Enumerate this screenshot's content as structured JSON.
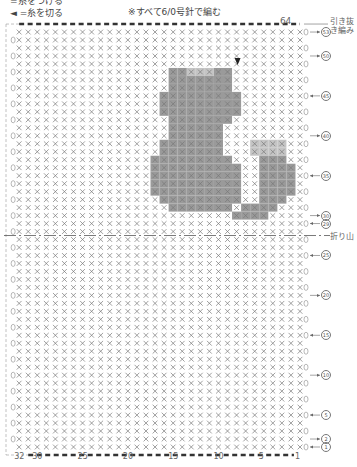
{
  "legend": {
    "attach_label": "=糸をつける",
    "cut_label": "◄ =糸を切る"
  },
  "note": "※すべて6/0号針で編む",
  "top_stitch_count": "64",
  "slip_stitch_label": "引き抜き編み",
  "fold_label": "折り山",
  "columns": {
    "count": 32,
    "bottom_labels": [
      "32",
      "30",
      "25",
      "20",
      "15",
      "10",
      "5",
      "1"
    ],
    "label_cols": [
      32,
      30,
      25,
      20,
      15,
      10,
      5,
      1
    ]
  },
  "rows": {
    "count": 53,
    "markers": [
      {
        "row": 53,
        "label": "53",
        "dir": "in"
      },
      {
        "row": 50,
        "label": "50",
        "dir": "in"
      },
      {
        "row": 45,
        "label": "45",
        "dir": "out"
      },
      {
        "row": 40,
        "label": "40",
        "dir": "in"
      },
      {
        "row": 35,
        "label": "35",
        "dir": "out"
      },
      {
        "row": 30,
        "label": "30",
        "dir": "in"
      },
      {
        "row": 29,
        "label": "29",
        "dir": "out"
      },
      {
        "row": 25,
        "label": "25",
        "dir": "out"
      },
      {
        "row": 20,
        "label": "20",
        "dir": "in"
      },
      {
        "row": 15,
        "label": "15",
        "dir": "out"
      },
      {
        "row": 10,
        "label": "10",
        "dir": "in"
      },
      {
        "row": 5,
        "label": "5",
        "dir": "out"
      },
      {
        "row": 2,
        "label": "2",
        "dir": "in"
      },
      {
        "row": 1,
        "label": "1",
        "dir": "out"
      }
    ]
  },
  "fold_row": 27.5,
  "colors": {
    "stitch": "#777777",
    "fill": "#9a9a9a",
    "fill_light": "#c4c4c4",
    "dash": "#333333"
  },
  "motif": [
    {
      "row": 48,
      "cols": [
        9,
        15
      ],
      "light": [
        11,
        13
      ]
    },
    {
      "row": 47,
      "cols": [
        9,
        15
      ]
    },
    {
      "row": 46,
      "cols": [
        9,
        15
      ]
    },
    {
      "row": 45,
      "cols": [
        8,
        16
      ]
    },
    {
      "row": 44,
      "cols": [
        8,
        16
      ]
    },
    {
      "row": 43,
      "cols": [
        8,
        16
      ]
    },
    {
      "row": 42,
      "cols": [
        9,
        15
      ]
    },
    {
      "row": 41,
      "cols": [
        10,
        15
      ]
    },
    {
      "row": 40,
      "cols": [
        10,
        15
      ]
    },
    {
      "row": 39,
      "cols": [
        10,
        16
      ],
      "light": [
        3,
        6
      ]
    },
    {
      "row": 38,
      "cols": [
        10,
        16
      ],
      "light": [
        3,
        6
      ]
    },
    {
      "row": 37,
      "cols": [
        9,
        17
      ],
      "tail": [
        3,
        5
      ]
    },
    {
      "row": 36,
      "cols": [
        8,
        17
      ],
      "tail": [
        2,
        5
      ]
    },
    {
      "row": 35,
      "cols": [
        8,
        17
      ],
      "tail": [
        2,
        5
      ]
    },
    {
      "row": 34,
      "cols": [
        8,
        17
      ],
      "tail": [
        2,
        5
      ]
    },
    {
      "row": 33,
      "cols": [
        8,
        17
      ],
      "tail": [
        2,
        5
      ]
    },
    {
      "row": 32,
      "cols": [
        8,
        16
      ],
      "tail": [
        3,
        5
      ]
    },
    {
      "row": 31,
      "cols": [
        9,
        15
      ],
      "tail": [
        4,
        7
      ]
    },
    {
      "row": 30,
      "cols": [
        5,
        8
      ]
    }
  ],
  "start_marker_col": 8,
  "start_marker_row": 49
}
